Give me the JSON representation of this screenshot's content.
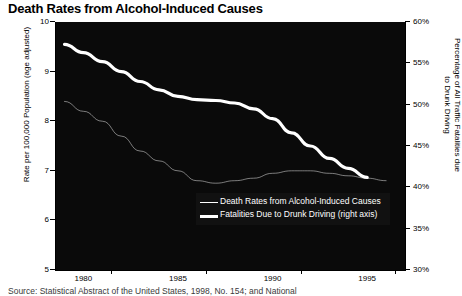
{
  "chart_data": {
    "type": "line",
    "title": "Death Rates from Alcohol-Induced Causes",
    "xlabel": "",
    "ylabel": "Rate per 100,000 Population (age adjusted)",
    "y2label": "Percentage of All Traffic Fatalities due to Drunk Driving",
    "xlim": [
      1978.5,
      1997.0
    ],
    "ylim": [
      5,
      10
    ],
    "y2lim": [
      30,
      60
    ],
    "grid": false,
    "legend_position": "inside-lower-right",
    "x_ticks": [
      1980,
      1985,
      1990,
      1995
    ],
    "x_ticklabels": [
      "1980",
      "1985",
      "1990",
      "1995"
    ],
    "y_ticks": [
      5,
      6,
      7,
      8,
      9,
      10
    ],
    "y_ticklabels": [
      "5",
      "6",
      "7",
      "8",
      "9",
      "10"
    ],
    "y2_ticks": [
      30,
      35,
      40,
      45,
      50,
      55,
      60
    ],
    "y2_ticklabels": [
      "30%",
      "35%",
      "40%",
      "45%",
      "50%",
      "55%",
      "60%"
    ],
    "series": [
      {
        "name": "Death Rates from Alcohol-Induced Causes",
        "axis": "left",
        "style": "thin",
        "color": "#d8d8d8",
        "x": [
          1979,
          1980,
          1981,
          1982,
          1983,
          1984,
          1985,
          1986,
          1987,
          1988,
          1989,
          1990,
          1991,
          1992,
          1993,
          1994,
          1995,
          1996
        ],
        "values": [
          8.4,
          8.2,
          8.0,
          7.7,
          7.4,
          7.2,
          7.0,
          6.8,
          6.75,
          6.8,
          6.85,
          6.95,
          7.0,
          7.0,
          6.95,
          6.9,
          6.85,
          6.8
        ]
      },
      {
        "name": "Fatalities Due to Drunk Driving (right axis)",
        "axis": "right",
        "style": "thick",
        "color": "#ffffff",
        "x": [
          1979,
          1980,
          1981,
          1982,
          1983,
          1984,
          1985,
          1986,
          1987,
          1988,
          1989,
          1990,
          1991,
          1992,
          1993,
          1994,
          1995
        ],
        "values": [
          57.3,
          56.3,
          55.2,
          54.0,
          52.8,
          51.8,
          51.0,
          50.6,
          50.5,
          50.2,
          49.5,
          48.3,
          46.6,
          45.0,
          43.5,
          42.3,
          41.2
        ]
      }
    ]
  },
  "legend": {
    "items": [
      {
        "label": "Death Rates from Alcohol-Induced Causes",
        "style": "thin"
      },
      {
        "label": "Fatalities Due to Drunk Driving (right axis)",
        "style": "thick"
      }
    ]
  },
  "source": {
    "text": "Source:  Statistical Abstract of the United States, 1998, No. 154; and National"
  },
  "colors": {
    "plot_background": "#0a0a0a",
    "line_primary": "#ffffff",
    "line_secondary": "#d8d8d8",
    "axis": "#000000"
  }
}
